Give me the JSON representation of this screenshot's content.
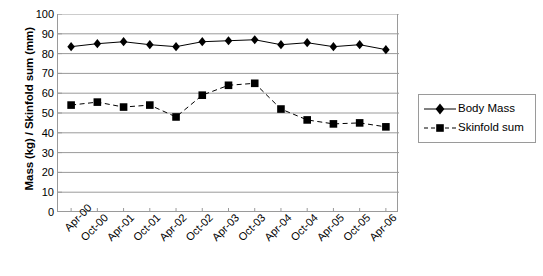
{
  "chart_data": {
    "type": "line",
    "title": "",
    "xlabel": "",
    "ylabel": "Mass (kg) / Skinfold sum (mm)",
    "ylim": [
      0,
      100
    ],
    "ytick_step": 10,
    "yticks": [
      "100",
      "90",
      "80",
      "70",
      "60",
      "50",
      "40",
      "30",
      "20",
      "10",
      "0"
    ],
    "grid": "horizontal",
    "legend_position": "right",
    "categories": [
      "Apr-00",
      "Oct-00",
      "Apr-01",
      "Oct-01",
      "Apr-02",
      "Oct-02",
      "Apr-03",
      "Oct-03",
      "Apr-04",
      "Oct-04",
      "Apr-05",
      "Oct-05",
      "Apr-06"
    ],
    "series": [
      {
        "name": "Body Mass",
        "marker": "diamond",
        "line": "solid",
        "color": "#000000",
        "values": [
          83.5,
          85,
          86,
          84.5,
          83.5,
          86,
          86.5,
          87,
          84.5,
          85.5,
          83.5,
          84.5,
          82
        ]
      },
      {
        "name": "Skinfold sum",
        "marker": "square",
        "line": "dashed",
        "color": "#000000",
        "values": [
          54,
          55.5,
          53,
          54,
          48,
          59,
          64,
          65,
          52,
          46.5,
          44.5,
          45,
          43
        ]
      }
    ]
  },
  "legend": {
    "items": [
      {
        "label": "Body Mass"
      },
      {
        "label": "Skinfold sum"
      }
    ]
  },
  "colors": {
    "axis": "#9a9a9a",
    "gridline": "#9a9a9a",
    "series": "#000000",
    "background": "#ffffff"
  }
}
